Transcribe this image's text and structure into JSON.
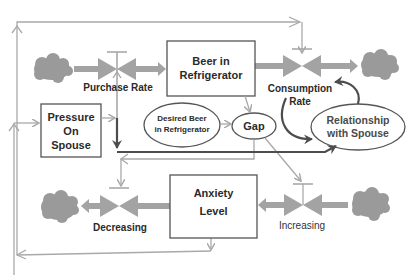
{
  "diagram": {
    "type": "stock-and-flow",
    "colors": {
      "line_gray": "#a9a9a9",
      "cloud_gray": "#9a9a9a",
      "valve_gray": "#a3a3a3",
      "dark_arrow": "#4d4d4d",
      "box_border": "#555555",
      "text": "#2a2a2a"
    },
    "stocks": [
      {
        "id": "beer",
        "label_line1": "Beer in",
        "label_line2": "Refrigerator"
      },
      {
        "id": "pressure",
        "label_line1": "Pressure",
        "label_line2": "On",
        "label_line3": "Spouse"
      },
      {
        "id": "anxiety",
        "label_line1": "Anxiety",
        "label_line2": "Level"
      }
    ],
    "flows": [
      {
        "id": "purchase",
        "label": "Purchase Rate"
      },
      {
        "id": "consumption",
        "label_line1": "Consumption",
        "label_line2": "Rate"
      },
      {
        "id": "decreasing",
        "label": "Decreasing"
      },
      {
        "id": "increasing",
        "label": "Increasing"
      }
    ],
    "auxiliaries": [
      {
        "id": "desired",
        "label_line1": "Desired Beer",
        "label_line2": "in Refrigerator"
      },
      {
        "id": "gap",
        "label": "Gap"
      },
      {
        "id": "relationship",
        "label_line1": "Relationship",
        "label_line2": "with Spouse"
      }
    ]
  }
}
